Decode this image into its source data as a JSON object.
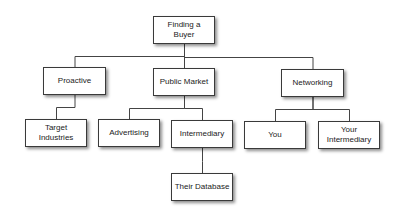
{
  "diagram": {
    "type": "org-chart",
    "nodes": [
      {
        "id": "root",
        "label": "Finding a Buyer",
        "parent": null
      },
      {
        "id": "proactive",
        "label": "Proactive",
        "parent": "root"
      },
      {
        "id": "public-market",
        "label": "Public Market",
        "parent": "root"
      },
      {
        "id": "networking",
        "label": "Networking",
        "parent": "root"
      },
      {
        "id": "target-industries",
        "label": "Target Industries",
        "parent": "proactive"
      },
      {
        "id": "advertising",
        "label": "Advertising",
        "parent": "public-market"
      },
      {
        "id": "intermediary",
        "label": "Intermediary",
        "parent": "public-market"
      },
      {
        "id": "you",
        "label": "You",
        "parent": "networking"
      },
      {
        "id": "your-intermediary",
        "label": "Your Intermediary",
        "parent": "networking"
      },
      {
        "id": "their-database",
        "label": "Their Database",
        "parent": "intermediary"
      }
    ]
  }
}
